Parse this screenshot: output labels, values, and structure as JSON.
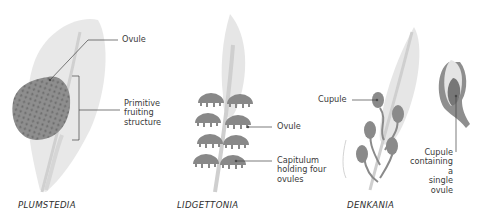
{
  "figures": [
    {
      "name": "PLUMSTEDIA",
      "labels": [
        {
          "text": "Ovule"
        },
        {
          "text": "Primitive\nfruiting\nstructure"
        }
      ]
    },
    {
      "name": "LIDGETTONIA",
      "labels": [
        {
          "text": "Ovule"
        },
        {
          "text": "Capitulum\nholding four\novules"
        }
      ]
    },
    {
      "name": "DENKANIA",
      "labels": [
        {
          "text": "Cupule"
        },
        {
          "text": "Cupule\ncontaining a\nsingle ovule"
        }
      ]
    }
  ],
  "colors": {
    "leaf": "#e6e6e6",
    "stem": "#cfcfcf",
    "organ": "#8c8c8c",
    "organ_dark": "#6e6e6e",
    "line": "#444444",
    "text": "#3a3a3a"
  }
}
